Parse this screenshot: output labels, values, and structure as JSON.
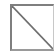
{
  "placeholder": {
    "icon": "broken-image-icon",
    "alt_text": "Image placeholder",
    "colors": {
      "border_dark": "#7f7f7f",
      "border_light": "#c8c8c8",
      "diagonal": "#6f6f6f",
      "background": "#ffffff"
    }
  }
}
